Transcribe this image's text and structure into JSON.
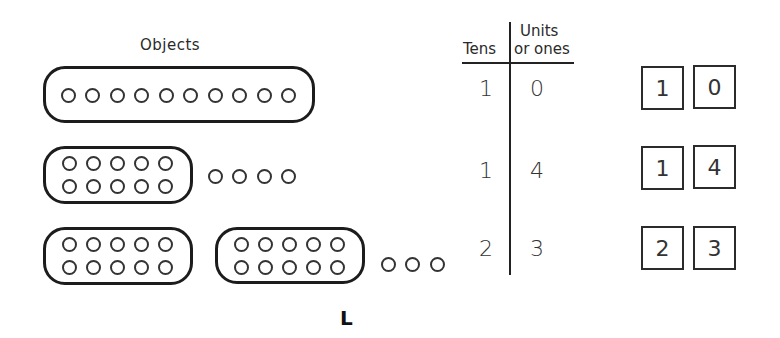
{
  "objects_section": {
    "title": "Objects",
    "rows": [
      {
        "groups_of_ten": 1,
        "ones": 0,
        "layout": "single-line"
      },
      {
        "groups_of_ten": 1,
        "ones": 4,
        "layout": "two-rows"
      },
      {
        "groups_of_ten": 2,
        "ones": 3,
        "layout": "two-rows"
      }
    ]
  },
  "place_value_table": {
    "header_tens": "Tens",
    "header_units_line1": "Units",
    "header_units_line2": "or ones",
    "rows": [
      {
        "tens": "1",
        "ones": "0"
      },
      {
        "tens": "1",
        "ones": "4"
      },
      {
        "tens": "2",
        "ones": "3"
      }
    ]
  },
  "digit_cards": [
    {
      "tens": "1",
      "ones": "0"
    },
    {
      "tens": "1",
      "ones": "4"
    },
    {
      "tens": "2",
      "ones": "3"
    }
  ],
  "figure_label": "L"
}
